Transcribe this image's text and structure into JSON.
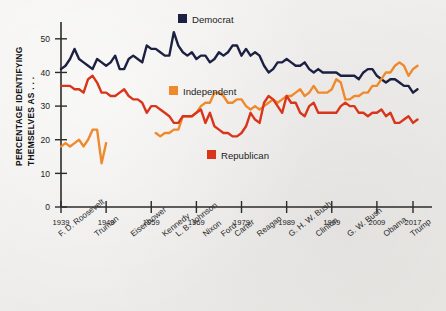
{
  "figure": {
    "background_color": "#efeeec",
    "axis_color": "#2b2b2b"
  },
  "chart_data": {
    "type": "line",
    "title": "",
    "xlabel": "",
    "ylabel": "PERCENTAGE IDENTIFYING THEMSELVES AS . . .",
    "xlim": [
      1939,
      2019
    ],
    "ylim": [
      0,
      55
    ],
    "grid": false,
    "legend_position": "inside-plot",
    "y_ticks": [
      0,
      10,
      20,
      30,
      40,
      50
    ],
    "x_ticks": [
      1939,
      1949,
      1959,
      1969,
      1979,
      1989,
      1999,
      2009,
      2017
    ],
    "x_tick_labels": [
      "1939",
      "1949",
      "1959",
      "1969",
      "1979",
      "1989",
      "1999",
      "2009",
      "2017"
    ],
    "president_labels": [
      {
        "name": "F. D. Roosevelt",
        "year": 1939
      },
      {
        "name": "Truman",
        "year": 1947
      },
      {
        "name": "Eisenhower",
        "year": 1955
      },
      {
        "name": "Kennedy",
        "year": 1962
      },
      {
        "name": "L. B. Johnson",
        "year": 1965
      },
      {
        "name": "Nixon",
        "year": 1971
      },
      {
        "name": "Ford",
        "year": 1975
      },
      {
        "name": "Carter",
        "year": 1978
      },
      {
        "name": "Reagan",
        "year": 1983
      },
      {
        "name": "G. H. W. Bush",
        "year": 1990
      },
      {
        "name": "Clinton",
        "year": 1996
      },
      {
        "name": "G. W. Bush",
        "year": 2003
      },
      {
        "name": "Obama",
        "year": 2011
      },
      {
        "name": "Trump",
        "year": 2017
      }
    ],
    "series": [
      {
        "name": "Democrat",
        "color": "#1c2142",
        "legend_label": "Democrat",
        "x": [
          1939,
          1940,
          1941,
          1942,
          1943,
          1944,
          1945,
          1946,
          1947,
          1948,
          1949,
          1950,
          1951,
          1952,
          1953,
          1954,
          1955,
          1956,
          1957,
          1958,
          1959,
          1960,
          1961,
          1962,
          1963,
          1964,
          1965,
          1966,
          1967,
          1968,
          1969,
          1970,
          1971,
          1972,
          1973,
          1974,
          1975,
          1976,
          1977,
          1978,
          1979,
          1980,
          1981,
          1982,
          1983,
          1984,
          1985,
          1986,
          1987,
          1988,
          1989,
          1990,
          1991,
          1992,
          1993,
          1994,
          1995,
          1996,
          1997,
          1998,
          1999,
          2000,
          2001,
          2002,
          2003,
          2004,
          2005,
          2006,
          2007,
          2008,
          2009,
          2010,
          2011,
          2012,
          2013,
          2014,
          2015,
          2016,
          2017,
          2018
        ],
        "values": [
          41,
          42,
          44,
          47,
          44,
          43,
          42,
          41,
          44,
          43,
          42,
          43,
          45,
          41,
          41,
          44,
          45,
          44,
          43,
          48,
          47,
          47,
          46,
          45,
          45,
          52,
          48,
          46,
          45,
          46,
          44,
          45,
          45,
          43,
          44,
          46,
          45,
          46,
          48,
          48,
          45,
          47,
          45,
          46,
          45,
          42,
          40,
          41,
          43,
          43,
          44,
          43,
          42,
          42,
          43,
          41,
          40,
          41,
          40,
          40,
          40,
          40,
          39,
          39,
          39,
          39,
          38,
          40,
          41,
          41,
          39,
          38,
          37,
          38,
          38,
          37,
          36,
          36,
          34,
          35
        ],
        "gaps": []
      },
      {
        "name": "Independent",
        "color": "#ef8a2c",
        "legend_label": "Independent",
        "x": [
          1939,
          1940,
          1941,
          1942,
          1943,
          1944,
          1945,
          1946,
          1947,
          1948,
          1949,
          1960,
          1961,
          1962,
          1963,
          1964,
          1965,
          1966,
          1967,
          1968,
          1969,
          1970,
          1971,
          1972,
          1973,
          1974,
          1975,
          1976,
          1977,
          1978,
          1979,
          1980,
          1981,
          1982,
          1983,
          1984,
          1985,
          1986,
          1987,
          1988,
          1989,
          1990,
          1991,
          1992,
          1993,
          1994,
          1995,
          1996,
          1997,
          1998,
          1999,
          2000,
          2001,
          2002,
          2003,
          2004,
          2005,
          2006,
          2007,
          2008,
          2009,
          2010,
          2011,
          2012,
          2013,
          2014,
          2015,
          2016,
          2017,
          2018
        ],
        "values": [
          18,
          19,
          18,
          19,
          20,
          18,
          20,
          23,
          23,
          13,
          19,
          22,
          21,
          22,
          22,
          23,
          23,
          27,
          27,
          27,
          28,
          30,
          31,
          31,
          34,
          34,
          33,
          31,
          31,
          32,
          32,
          30,
          29,
          30,
          29,
          30,
          31,
          32,
          31,
          32,
          33,
          33,
          34,
          35,
          33,
          34,
          36,
          34,
          34,
          34,
          35,
          38,
          37,
          32,
          32,
          33,
          33,
          34,
          34,
          36,
          36,
          38,
          40,
          40,
          42,
          43,
          42,
          39,
          41,
          42
        ],
        "gaps": [
          [
            1949,
            1960
          ]
        ]
      },
      {
        "name": "Republican",
        "color": "#d8351b",
        "legend_label": "Republican",
        "x": [
          1939,
          1940,
          1941,
          1942,
          1943,
          1944,
          1945,
          1946,
          1947,
          1948,
          1949,
          1950,
          1951,
          1952,
          1953,
          1954,
          1955,
          1956,
          1957,
          1958,
          1959,
          1960,
          1961,
          1962,
          1963,
          1964,
          1965,
          1966,
          1967,
          1968,
          1969,
          1970,
          1971,
          1972,
          1973,
          1974,
          1975,
          1976,
          1977,
          1978,
          1979,
          1980,
          1981,
          1982,
          1983,
          1984,
          1985,
          1986,
          1987,
          1988,
          1989,
          1990,
          1991,
          1992,
          1993,
          1994,
          1995,
          1996,
          1997,
          1998,
          1999,
          2000,
          2001,
          2002,
          2003,
          2004,
          2005,
          2006,
          2007,
          2008,
          2009,
          2010,
          2011,
          2012,
          2013,
          2014,
          2015,
          2016,
          2017,
          2018
        ],
        "values": [
          36,
          36,
          36,
          35,
          35,
          34,
          38,
          39,
          37,
          34,
          34,
          33,
          33,
          34,
          35,
          33,
          32,
          32,
          31,
          28,
          30,
          30,
          29,
          28,
          27,
          25,
          25,
          27,
          27,
          27,
          28,
          29,
          25,
          28,
          24,
          23,
          22,
          22,
          21,
          21,
          22,
          24,
          28,
          26,
          25,
          31,
          33,
          32,
          30,
          28,
          33,
          31,
          31,
          28,
          27,
          30,
          31,
          28,
          28,
          28,
          28,
          28,
          30,
          31,
          30,
          30,
          28,
          28,
          27,
          28,
          28,
          29,
          27,
          28,
          25,
          25,
          26,
          27,
          25,
          26
        ],
        "gaps": []
      }
    ]
  }
}
